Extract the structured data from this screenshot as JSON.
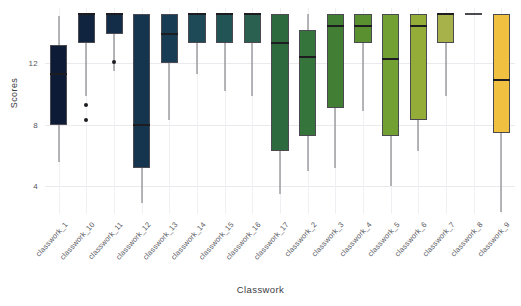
{
  "chart_data": {
    "type": "box",
    "title": "",
    "xlabel": "Classwork",
    "ylabel": "Scores",
    "ylim": [
      2.2,
      15.6
    ],
    "yticks": [
      12,
      8,
      4
    ],
    "ytick_labels": [
      "12",
      "8",
      "4"
    ],
    "grid": true,
    "legend": "none",
    "colormap": "viridis-like (dark navy -> teal -> green -> yellow)",
    "categories": [
      "classwork_1",
      "classwork_10",
      "classwork_11",
      "classwork_12",
      "classwork_13",
      "classwork_14",
      "classwork_15",
      "classwork_16",
      "classwork_17",
      "classwork_2",
      "classwork_3",
      "classwork_4",
      "classwork_5",
      "classwork_6",
      "classwork_7",
      "classwork_8",
      "classwork_9"
    ],
    "boxes": [
      {
        "category": "classwork_1",
        "whislo": 5.6,
        "q1": 8.0,
        "med": 11.3,
        "q3": 13.2,
        "whishi": 15.1,
        "fliers": [],
        "color": "#0d1b36"
      },
      {
        "category": "classwork_10",
        "whislo": 9.9,
        "q1": 13.3,
        "med": 15.2,
        "q3": 15.2,
        "whishi": 15.2,
        "fliers": [
          9.3,
          8.3
        ],
        "color": "#10243f"
      },
      {
        "category": "classwork_11",
        "whislo": 11.5,
        "q1": 13.9,
        "med": 15.2,
        "q3": 15.2,
        "whishi": 15.2,
        "fliers": [
          12.1
        ],
        "color": "#132c47"
      },
      {
        "category": "classwork_12",
        "whislo": 2.9,
        "q1": 5.2,
        "med": 8.0,
        "q3": 15.2,
        "whishi": 15.2,
        "fliers": [],
        "color": "#15344e"
      },
      {
        "category": "classwork_13",
        "whislo": 8.3,
        "q1": 12.0,
        "med": 13.9,
        "q3": 15.2,
        "whishi": 15.2,
        "fliers": [],
        "color": "#183c53"
      },
      {
        "category": "classwork_14",
        "whislo": 11.3,
        "q1": 13.3,
        "med": 15.2,
        "q3": 15.2,
        "whishi": 15.2,
        "fliers": [],
        "color": "#1d4a56"
      },
      {
        "category": "classwork_15",
        "whislo": 10.2,
        "q1": 13.3,
        "med": 15.2,
        "q3": 15.2,
        "whishi": 15.2,
        "fliers": [],
        "color": "#225455"
      },
      {
        "category": "classwork_16",
        "whislo": 9.9,
        "q1": 13.3,
        "med": 15.2,
        "q3": 15.2,
        "whishi": 15.2,
        "fliers": [],
        "color": "#2a6050"
      },
      {
        "category": "classwork_17",
        "whislo": 3.5,
        "q1": 6.3,
        "med": 13.3,
        "q3": 15.2,
        "whishi": 15.2,
        "fliers": [],
        "color": "#2d6b3e"
      },
      {
        "category": "classwork_2",
        "whislo": 5.0,
        "q1": 7.3,
        "med": 12.4,
        "q3": 14.2,
        "whishi": 15.2,
        "fliers": [],
        "color": "#35743a"
      },
      {
        "category": "classwork_3",
        "whislo": 5.2,
        "q1": 9.1,
        "med": 14.4,
        "q3": 15.2,
        "whishi": 15.2,
        "fliers": [],
        "color": "#437e35"
      },
      {
        "category": "classwork_4",
        "whislo": 8.9,
        "q1": 13.3,
        "med": 14.4,
        "q3": 15.2,
        "whishi": 15.2,
        "fliers": [],
        "color": "#5a9030"
      },
      {
        "category": "classwork_5",
        "whislo": 4.0,
        "q1": 7.3,
        "med": 12.3,
        "q3": 15.2,
        "whishi": 15.2,
        "fliers": [],
        "color": "#72a033"
      },
      {
        "category": "classwork_6",
        "whislo": 6.3,
        "q1": 8.3,
        "med": 14.4,
        "q3": 15.2,
        "whishi": 15.2,
        "fliers": [],
        "color": "#93ad38"
      },
      {
        "category": "classwork_7",
        "whislo": 9.9,
        "q1": 13.3,
        "med": 15.2,
        "q3": 15.2,
        "whishi": 15.2,
        "fliers": [],
        "color": "#a8b24a"
      },
      {
        "category": "classwork_8",
        "whislo": 15.3,
        "q1": 15.3,
        "med": 15.3,
        "q3": 15.3,
        "whishi": 15.3,
        "fliers": [],
        "color": "#3b3b42"
      },
      {
        "category": "classwork_9",
        "whislo": 2.3,
        "q1": 7.5,
        "med": 10.9,
        "q3": 15.2,
        "whishi": 15.2,
        "fliers": [],
        "color": "#f0c040"
      }
    ]
  }
}
